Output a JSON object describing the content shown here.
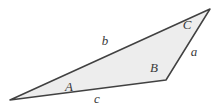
{
  "diagram": {
    "background_color": "#ffffff",
    "fill_color": "#ededed",
    "stroke_color": "#414141",
    "label_color": "#3a3a3a",
    "triangle": {
      "points": "10,100 210,9 166,80",
      "vertices": [
        {
          "name": "vertex-A",
          "x": 10,
          "y": 100
        },
        {
          "name": "vertex-C",
          "x": 210,
          "y": 9
        },
        {
          "name": "vertex-B",
          "x": 166,
          "y": 80
        }
      ]
    },
    "labels": [
      {
        "text": "A",
        "x": 69,
        "y": 91,
        "kind": "vertex-angle"
      },
      {
        "text": "B",
        "x": 154,
        "y": 72,
        "kind": "vertex-angle"
      },
      {
        "text": "C",
        "x": 187,
        "y": 29,
        "kind": "vertex-angle"
      },
      {
        "text": "a",
        "x": 194,
        "y": 56,
        "kind": "side"
      },
      {
        "text": "b",
        "x": 105,
        "y": 45,
        "kind": "side"
      },
      {
        "text": "c",
        "x": 97,
        "y": 103,
        "kind": "side"
      }
    ]
  }
}
